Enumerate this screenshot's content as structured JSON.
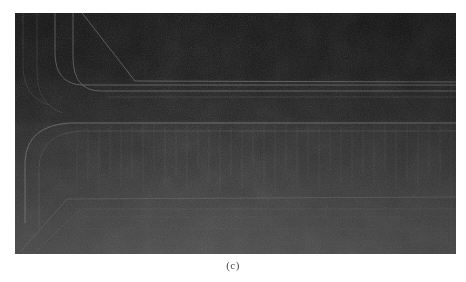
{
  "figure": {
    "caption": "(c)",
    "panel_label": "c",
    "panel": {
      "x": 15,
      "y": 13,
      "width": 441,
      "height": 241,
      "background_top_color": "#141414",
      "background_bottom_color": "#4a4a4a",
      "line_color": "#8d8d8d",
      "noise_color": "#2a2a2a",
      "description": "dark low-contrast scanned cross-section micrograph"
    },
    "page_background": "#ffffff",
    "regions": [
      {
        "name": "upper-dark-field",
        "y_top": 0,
        "y_bottom": 72,
        "tone": "#141414"
      },
      {
        "name": "upper-layer-band",
        "y_top": 72,
        "y_bottom": 78,
        "tone": "#1c1c1c"
      },
      {
        "name": "mid-dark-band",
        "y_top": 78,
        "y_bottom": 110,
        "tone": "#212121"
      },
      {
        "name": "striated-column-field",
        "y_top": 110,
        "y_bottom": 182,
        "tone": "#303030"
      },
      {
        "name": "lower-substrate",
        "y_top": 182,
        "y_bottom": 241,
        "tone": "#434343"
      }
    ],
    "horizontal_boundaries": [
      {
        "name": "boundary-upper-1",
        "y": 72
      },
      {
        "name": "boundary-upper-2",
        "y": 78
      },
      {
        "name": "boundary-mid",
        "y": 110
      },
      {
        "name": "boundary-lower",
        "y": 182
      }
    ],
    "vertical_features": {
      "name": "column-striations",
      "count": 34,
      "x_start": 60,
      "x_end": 430,
      "y_top": 112,
      "y_bottom": 180
    },
    "left_curved_features": {
      "name": "rounded-corner-transitions",
      "count": 4,
      "description": "vertical traces at left curving into the horizontal layer boundaries"
    }
  }
}
